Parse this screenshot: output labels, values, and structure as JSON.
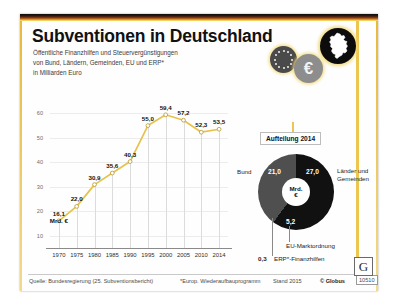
{
  "poster": {
    "title": "Subventionen in Deutschland",
    "subtitle": "Öffentliche Finanzhilfen und Steuervergünstigungen\nvon Bund, Ländern, Gemeinden, EU und ERP*\nin Milliarden Euro",
    "euro_symbol": "€"
  },
  "chart_data": {
    "type": "line",
    "title": "Subventionen in Deutschland",
    "ylabel": "in Milliarden Euro",
    "xlabel": "",
    "categories": [
      "1970",
      "1975",
      "1980",
      "1985",
      "1990",
      "1995",
      "2000",
      "2005",
      "2010",
      "2014"
    ],
    "values": [
      16.1,
      22.0,
      30.9,
      35.6,
      40.3,
      55.0,
      59.4,
      57.2,
      52.3,
      53.5
    ],
    "value_labels": [
      "16,1",
      "22,0",
      "30,9",
      "35,6",
      "40,3",
      "55,0",
      "59,4",
      "57,2",
      "52,3",
      "53,5"
    ],
    "unit_note": "Mrd. €",
    "yticks": [
      10,
      20,
      30,
      40,
      50,
      60
    ],
    "ytick_labels": [
      "10",
      "20",
      "30",
      "40",
      "50",
      "60"
    ],
    "ylim": [
      5,
      63
    ],
    "grid": "vertical-at-categories",
    "legend": "none",
    "line_color": "#e8c24a",
    "marker": "open-circle"
  },
  "pie": {
    "title": "Aufteilung 2014",
    "center_line1": "Mrd.",
    "center_line2": "€",
    "type": "pie",
    "slices": [
      {
        "name": "Länder und Gemeinden",
        "value": 27.0,
        "label": "27,0",
        "color": "#111111"
      },
      {
        "name": "Bund",
        "value": 21.0,
        "label": "21,0",
        "color": "#4f4f4f"
      },
      {
        "name": "EU-Marktordnung",
        "value": 5.2,
        "label": "5,2",
        "color": "#111111"
      },
      {
        "name": "ERP*-Finanzhilfen",
        "value": 0.3,
        "label": "0,3",
        "color": "#4f4f4f"
      }
    ],
    "label_bund": "Bund",
    "label_laender_1": "Länder und",
    "label_laender_2": "Gemeinden",
    "label_eu": "EU-Marktordnung",
    "label_erp": "ERP*-Finanzhilfen"
  },
  "footer": {
    "source": "Quelle: Bundesregierung (25. Subventionsbericht)",
    "note": "*Europ. Wiederaufbauprogramm",
    "stand": "Stand 2015",
    "copyright": "© Globus",
    "number": "10510",
    "logo_letter": "G"
  }
}
